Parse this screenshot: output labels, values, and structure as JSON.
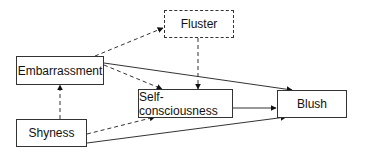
{
  "diagram": {
    "nodes": [
      {
        "id": "fluster",
        "label": "Fluster",
        "style": "dashed"
      },
      {
        "id": "embarrassment",
        "label": "Embarrassment",
        "style": "solid"
      },
      {
        "id": "self_consciousness",
        "label": "Self-consciousness",
        "style": "solid"
      },
      {
        "id": "blush",
        "label": "Blush",
        "style": "solid"
      },
      {
        "id": "shyness",
        "label": "Shyness",
        "style": "solid"
      }
    ],
    "edges": [
      {
        "from": "embarrassment",
        "to": "fluster",
        "style": "dashed"
      },
      {
        "from": "embarrassment",
        "to": "self_consciousness",
        "style": "dashed"
      },
      {
        "from": "embarrassment",
        "to": "blush",
        "style": "solid"
      },
      {
        "from": "fluster",
        "to": "self_consciousness",
        "style": "dashed"
      },
      {
        "from": "shyness",
        "to": "embarrassment",
        "style": "dashed"
      },
      {
        "from": "shyness",
        "to": "self_consciousness",
        "style": "dashed"
      },
      {
        "from": "shyness",
        "to": "blush",
        "style": "solid"
      },
      {
        "from": "self_consciousness",
        "to": "blush",
        "style": "solid"
      }
    ]
  }
}
